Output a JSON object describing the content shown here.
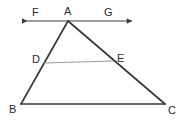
{
  "figure": {
    "kind": "geometry-diagram",
    "width": 181,
    "height": 121,
    "background_color": "#ffffff",
    "stroke_color": "#3a3a3a",
    "light_stroke_color": "#8f8f8f",
    "label_color": "#2b2b2b",
    "points": {
      "A": {
        "label": "A",
        "x": 68,
        "y": 21
      },
      "B": {
        "label": "B",
        "x": 21,
        "y": 104
      },
      "C": {
        "label": "C",
        "x": 165,
        "y": 104
      },
      "D": {
        "label": "D",
        "x": 44,
        "y": 63
      },
      "E": {
        "label": "E",
        "x": 113,
        "y": 61
      },
      "F": {
        "label": "F",
        "x": 18,
        "y": 21
      },
      "G": {
        "label": "G",
        "x": 136,
        "y": 21
      }
    },
    "segments": [
      {
        "name": "side-AB",
        "from": "A",
        "to": "B",
        "weight": "heavy"
      },
      {
        "name": "side-AC",
        "from": "A",
        "to": "C",
        "weight": "heavy"
      },
      {
        "name": "side-BC",
        "from": "B",
        "to": "C",
        "weight": "heavy"
      },
      {
        "name": "segment-DE",
        "from": "D",
        "to": "E",
        "weight": "light"
      }
    ],
    "rays": [
      {
        "name": "line-FG",
        "from": "F",
        "to": "G",
        "arrows": "both",
        "weight": "medium"
      }
    ]
  }
}
